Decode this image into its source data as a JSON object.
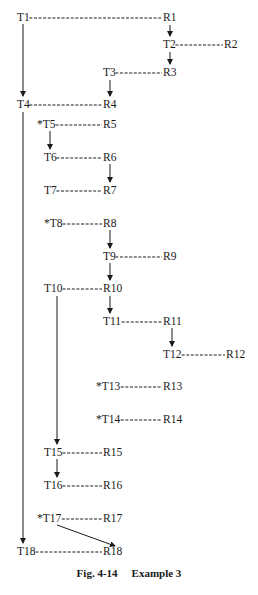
{
  "caption": {
    "fig": "Fig. 4-14",
    "title": "Example 3"
  },
  "nodes": [
    {
      "id": "T1",
      "label": "T1",
      "x": 17,
      "y": 11
    },
    {
      "id": "R1",
      "label": "R1",
      "x": 163,
      "y": 11
    },
    {
      "id": "T2",
      "label": "T2",
      "x": 163,
      "y": 38
    },
    {
      "id": "R2",
      "label": "R2",
      "x": 224,
      "y": 38
    },
    {
      "id": "T3",
      "label": "T3",
      "x": 103,
      "y": 66
    },
    {
      "id": "R3",
      "label": "R3",
      "x": 163,
      "y": 66
    },
    {
      "id": "T4",
      "label": "T4",
      "x": 17,
      "y": 98
    },
    {
      "id": "R4",
      "label": "R4",
      "x": 103,
      "y": 98
    },
    {
      "id": "T5",
      "label": "*T5",
      "x": 37,
      "y": 118
    },
    {
      "id": "R5",
      "label": "R5",
      "x": 103,
      "y": 118
    },
    {
      "id": "T6",
      "label": "T6",
      "x": 44,
      "y": 151
    },
    {
      "id": "R6",
      "label": "R6",
      "x": 103,
      "y": 151
    },
    {
      "id": "T7",
      "label": "T7",
      "x": 44,
      "y": 184
    },
    {
      "id": "R7",
      "label": "R7",
      "x": 103,
      "y": 184
    },
    {
      "id": "T8",
      "label": "*T8",
      "x": 44,
      "y": 217
    },
    {
      "id": "R8",
      "label": "R8",
      "x": 103,
      "y": 217
    },
    {
      "id": "T9",
      "label": "T9",
      "x": 103,
      "y": 250
    },
    {
      "id": "R9",
      "label": "R9",
      "x": 163,
      "y": 250
    },
    {
      "id": "T10",
      "label": "T10",
      "x": 44,
      "y": 282
    },
    {
      "id": "R10",
      "label": "R10",
      "x": 103,
      "y": 282
    },
    {
      "id": "T11",
      "label": "T11",
      "x": 103,
      "y": 315
    },
    {
      "id": "R11",
      "label": "R11",
      "x": 163,
      "y": 315
    },
    {
      "id": "T12",
      "label": "T12",
      "x": 163,
      "y": 348
    },
    {
      "id": "R12",
      "label": "R12",
      "x": 226,
      "y": 348
    },
    {
      "id": "T13",
      "label": "*T13",
      "x": 96,
      "y": 380
    },
    {
      "id": "R13",
      "label": "R13",
      "x": 163,
      "y": 380
    },
    {
      "id": "T14",
      "label": "*T14",
      "x": 96,
      "y": 413
    },
    {
      "id": "R14",
      "label": "R14",
      "x": 163,
      "y": 413
    },
    {
      "id": "T15",
      "label": "T15",
      "x": 44,
      "y": 446
    },
    {
      "id": "R15",
      "label": "R15",
      "x": 103,
      "y": 446
    },
    {
      "id": "T16",
      "label": "T16",
      "x": 44,
      "y": 479
    },
    {
      "id": "R16",
      "label": "R16",
      "x": 103,
      "y": 479
    },
    {
      "id": "T17",
      "label": "*T17",
      "x": 37,
      "y": 512
    },
    {
      "id": "R17",
      "label": "R17",
      "x": 103,
      "y": 512
    },
    {
      "id": "T18",
      "label": "T18",
      "x": 17,
      "y": 545
    },
    {
      "id": "R18",
      "label": "R18",
      "x": 103,
      "y": 545
    }
  ],
  "dashed_links": [
    [
      "T1",
      "R1"
    ],
    [
      "T2",
      "R2"
    ],
    [
      "T3",
      "R3"
    ],
    [
      "T4",
      "R4"
    ],
    [
      "T5",
      "R5"
    ],
    [
      "T6",
      "R6"
    ],
    [
      "T7",
      "R7"
    ],
    [
      "T8",
      "R8"
    ],
    [
      "T9",
      "R9"
    ],
    [
      "T10",
      "R10"
    ],
    [
      "T11",
      "R11"
    ],
    [
      "T12",
      "R12"
    ],
    [
      "T13",
      "R13"
    ],
    [
      "T14",
      "R14"
    ],
    [
      "T15",
      "R15"
    ],
    [
      "T16",
      "R16"
    ],
    [
      "T17",
      "R17"
    ],
    [
      "T18",
      "R18"
    ]
  ],
  "arrows": [
    {
      "from": "T1",
      "to": "T4"
    },
    {
      "from": "R1",
      "to": "T2"
    },
    {
      "from": "T2",
      "to": "R3"
    },
    {
      "from": "T3",
      "to": "R4"
    },
    {
      "from": "T4",
      "to": "T18"
    },
    {
      "from": "T5",
      "to": "T6"
    },
    {
      "from": "R6",
      "to": "R7"
    },
    {
      "from": "R8",
      "to": "T9"
    },
    {
      "from": "T9",
      "to": "R10"
    },
    {
      "from": "R10",
      "to": "T11"
    },
    {
      "from": "R11",
      "to": "T12"
    },
    {
      "from": "T10",
      "to": "T15"
    },
    {
      "from": "T15",
      "to": "T16"
    },
    {
      "from": "T17",
      "to": "R18"
    }
  ]
}
